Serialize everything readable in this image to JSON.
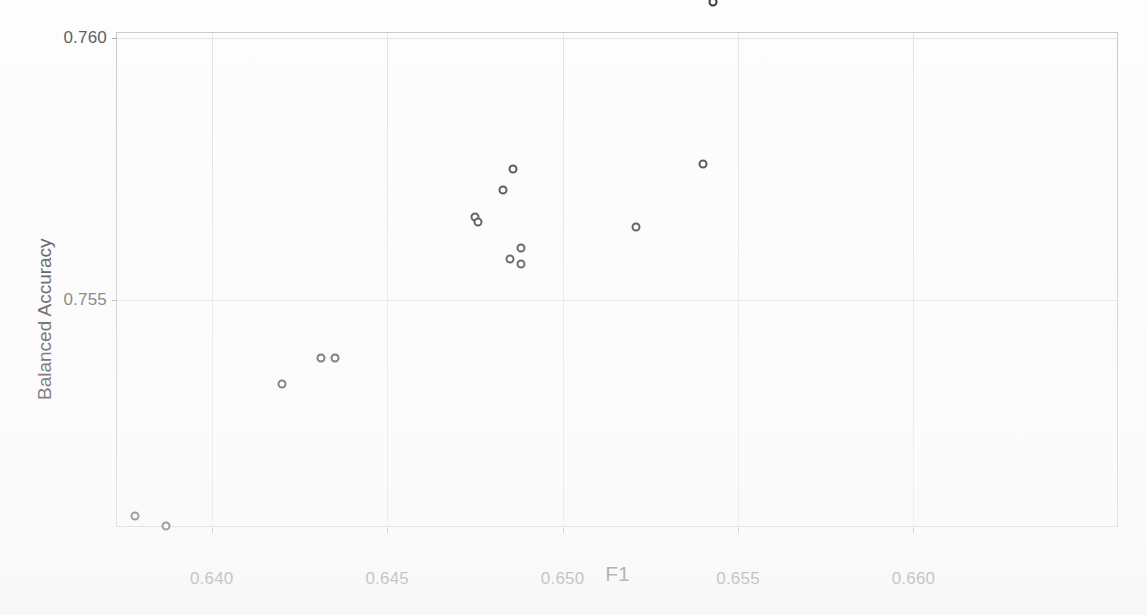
{
  "chart_data": {
    "type": "scatter",
    "title": "",
    "xlabel": "F1",
    "ylabel": "Balanced Accuracy",
    "xlim": [
      0.6373,
      0.6658
    ],
    "ylim": [
      0.7507,
      0.7601
    ],
    "xticks": [
      0.64,
      0.645,
      0.65,
      0.655,
      0.66
    ],
    "xtick_labels": [
      "0.640",
      "0.645",
      "0.650",
      "0.655",
      "0.660"
    ],
    "yticks": [
      0.755,
      0.76
    ],
    "ytick_labels": [
      "0.755",
      "0.760"
    ],
    "grid": true,
    "legend": "none",
    "series": [
      {
        "name": "candidates",
        "marker": "open-circle",
        "color": "#3b3b3b",
        "points": [
          {
            "x": 0.6378,
            "y": 0.7509
          },
          {
            "x": 0.6387,
            "y": 0.7507
          },
          {
            "x": 0.642,
            "y": 0.7534
          },
          {
            "x": 0.6431,
            "y": 0.7539
          },
          {
            "x": 0.6435,
            "y": 0.7539
          },
          {
            "x": 0.6475,
            "y": 0.7566
          },
          {
            "x": 0.6476,
            "y": 0.7565
          },
          {
            "x": 0.6483,
            "y": 0.7571
          },
          {
            "x": 0.6486,
            "y": 0.7575
          },
          {
            "x": 0.6485,
            "y": 0.7558
          },
          {
            "x": 0.6488,
            "y": 0.756
          },
          {
            "x": 0.6488,
            "y": 0.7557
          },
          {
            "x": 0.6521,
            "y": 0.7564
          },
          {
            "x": 0.654,
            "y": 0.7576
          },
          {
            "x": 0.6543,
            "y": 0.7607
          },
          {
            "x": 0.6593,
            "y": 0.7617
          },
          {
            "x": 0.6605,
            "y": 0.7624
          },
          {
            "x": 0.661,
            "y": 0.763
          }
        ]
      },
      {
        "name": "selected-best",
        "marker": "filled-circle",
        "color": "#101010",
        "points": [
          {
            "x": 0.6618,
            "y": 0.7639
          }
        ]
      }
    ]
  },
  "axes": {
    "x_label": "F1",
    "y_label": "Balanced Accuracy",
    "x_tick_labels": [
      "0.640",
      "0.645",
      "0.650",
      "0.655",
      "0.660"
    ],
    "y_tick_labels": [
      "0.755",
      "0.760"
    ]
  }
}
